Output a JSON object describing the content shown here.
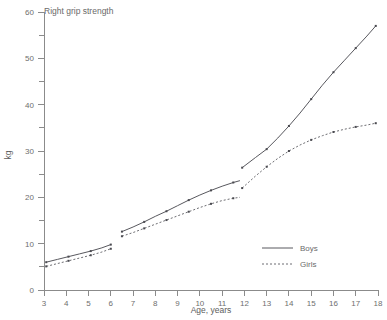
{
  "chart_data": {
    "type": "line",
    "title": "Right grip strength",
    "xlabel": "Age, years",
    "ylabel": "kg",
    "xlim": [
      3,
      18
    ],
    "ylim": [
      0,
      60
    ],
    "xticks": [
      3,
      4,
      5,
      6,
      7,
      8,
      9,
      10,
      11,
      12,
      13,
      14,
      15,
      16,
      17,
      18
    ],
    "yticks": [
      0,
      10,
      20,
      30,
      40,
      50,
      60
    ],
    "yminorticks": [
      5,
      15,
      25,
      35,
      45,
      55
    ],
    "grid": false,
    "legend_position": "inside-lower-right",
    "series": [
      {
        "name": "Boys",
        "style": "solid",
        "segments": [
          {
            "x": [
              3.1,
              3.6,
              4.1,
              4.6,
              5.1,
              5.6,
              6.0
            ],
            "y": [
              6.0,
              6.6,
              7.2,
              7.8,
              8.4,
              9.1,
              9.8
            ]
          },
          {
            "x": [
              6.5,
              7.0,
              7.5,
              8.0,
              8.5,
              9.0,
              9.5,
              10.0,
              10.5,
              11.0,
              11.5,
              11.8
            ],
            "y": [
              12.6,
              13.6,
              14.7,
              15.9,
              17.0,
              18.2,
              19.4,
              20.5,
              21.5,
              22.4,
              23.2,
              23.6
            ]
          },
          {
            "x": [
              11.9,
              12.5,
              13.0,
              13.5,
              14.0,
              14.5,
              15.0,
              15.5,
              16.0,
              16.5,
              17.0,
              17.5,
              17.9
            ],
            "y": [
              26.4,
              28.6,
              30.4,
              32.8,
              35.4,
              38.2,
              41.2,
              44.2,
              47.0,
              49.6,
              52.2,
              54.8,
              57.0
            ]
          }
        ]
      },
      {
        "name": "Girls",
        "style": "dotted",
        "segments": [
          {
            "x": [
              3.1,
              3.6,
              4.1,
              4.6,
              5.1,
              5.6,
              6.0
            ],
            "y": [
              5.1,
              5.7,
              6.3,
              6.9,
              7.5,
              8.2,
              8.9
            ]
          },
          {
            "x": [
              6.5,
              7.0,
              7.5,
              8.0,
              8.5,
              9.0,
              9.5,
              10.0,
              10.5,
              11.0,
              11.5,
              11.8
            ],
            "y": [
              11.6,
              12.4,
              13.3,
              14.2,
              15.1,
              16.0,
              16.9,
              17.8,
              18.6,
              19.3,
              19.8,
              20.0
            ]
          },
          {
            "x": [
              11.9,
              12.5,
              13.0,
              13.5,
              14.0,
              14.5,
              15.0,
              15.5,
              16.0,
              16.5,
              17.0,
              17.5,
              17.9
            ],
            "y": [
              22.0,
              24.6,
              26.6,
              28.4,
              30.0,
              31.3,
              32.4,
              33.3,
              34.1,
              34.7,
              35.2,
              35.6,
              36.0
            ]
          }
        ]
      }
    ],
    "markers": {
      "boys": [
        {
          "x": 3.1,
          "y": 6.0
        },
        {
          "x": 4.1,
          "y": 7.2
        },
        {
          "x": 5.1,
          "y": 8.4
        },
        {
          "x": 6.0,
          "y": 9.8
        },
        {
          "x": 6.5,
          "y": 12.6
        },
        {
          "x": 7.5,
          "y": 14.7
        },
        {
          "x": 8.5,
          "y": 17.0
        },
        {
          "x": 9.5,
          "y": 19.4
        },
        {
          "x": 10.5,
          "y": 21.5
        },
        {
          "x": 11.5,
          "y": 23.2
        },
        {
          "x": 11.9,
          "y": 26.4
        },
        {
          "x": 13.0,
          "y": 30.4
        },
        {
          "x": 14.0,
          "y": 35.4
        },
        {
          "x": 15.0,
          "y": 41.2
        },
        {
          "x": 16.0,
          "y": 47.0
        },
        {
          "x": 17.0,
          "y": 52.2
        },
        {
          "x": 17.9,
          "y": 57.0
        }
      ],
      "girls": [
        {
          "x": 3.1,
          "y": 5.1
        },
        {
          "x": 4.1,
          "y": 6.3
        },
        {
          "x": 5.1,
          "y": 7.5
        },
        {
          "x": 6.0,
          "y": 8.9
        },
        {
          "x": 6.5,
          "y": 11.6
        },
        {
          "x": 7.5,
          "y": 13.3
        },
        {
          "x": 8.5,
          "y": 15.1
        },
        {
          "x": 9.5,
          "y": 16.9
        },
        {
          "x": 10.5,
          "y": 18.6
        },
        {
          "x": 11.5,
          "y": 19.8
        },
        {
          "x": 11.9,
          "y": 22.0
        },
        {
          "x": 13.0,
          "y": 26.6
        },
        {
          "x": 14.0,
          "y": 30.0
        },
        {
          "x": 15.0,
          "y": 32.4
        },
        {
          "x": 16.0,
          "y": 34.1
        },
        {
          "x": 17.0,
          "y": 35.2
        },
        {
          "x": 17.9,
          "y": 36.0
        }
      ]
    }
  },
  "legend": {
    "items": [
      {
        "label": "Boys",
        "style": "solid"
      },
      {
        "label": "Girls",
        "style": "dotted"
      }
    ]
  },
  "colors": {
    "axis": "#8b8b8b",
    "text": "#6a6a6a",
    "boys": "#58585e",
    "girls": "#6d6d72",
    "background": "#ffffff"
  }
}
